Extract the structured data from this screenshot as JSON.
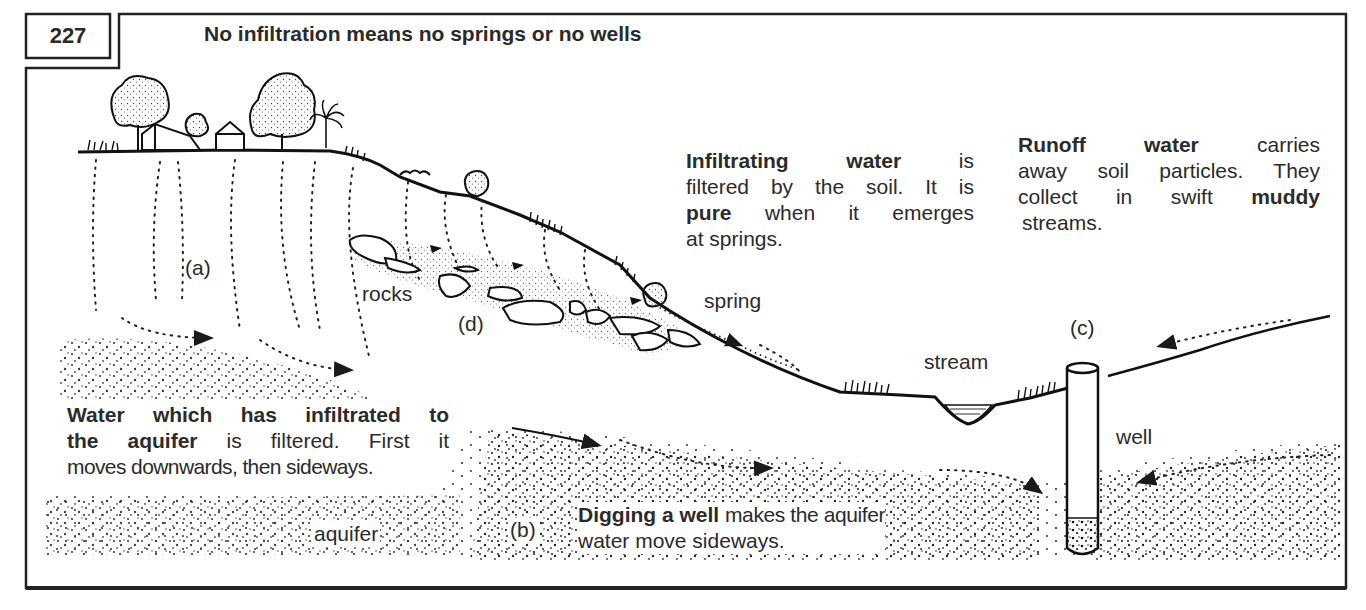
{
  "figure": {
    "number": "227",
    "title": "No infiltration means no springs or no wells"
  },
  "annotations": {
    "infiltrating": {
      "line1_bold_a": "Infiltrating",
      "line1_bold_b": "water",
      "line1_rest": "is",
      "line2": "filtered by the soil. It is",
      "line3_bold": "pure",
      "line3_rest": "when it emerges",
      "line4": "at springs."
    },
    "runoff": {
      "line1_bold_a": "Runoff",
      "line1_bold_b": "water",
      "line1_rest": "carries",
      "line2": "away soil particles. They",
      "line3_a": "collect in swift",
      "line3_bold": "muddy",
      "line4": "streams."
    },
    "aquifer_note": {
      "line1_bold": "Water which has infiltrated to",
      "line2_bold": "the aquifer",
      "line2_rest": "is filtered. First it",
      "line3": "moves downwards, then sideways."
    },
    "well_note": {
      "line1_bold": "Digging a well",
      "line1_rest": "makes the aquifer",
      "line2": "water move sideways."
    }
  },
  "labels": {
    "a": "(a)",
    "b": "(b)",
    "c": "(c)",
    "d": "(d)",
    "rocks": "rocks",
    "spring": "spring",
    "stream": "stream",
    "well": "well",
    "aquifer": "aquifer"
  },
  "colors": {
    "ink": "#1e1e1e",
    "text": "#2b2b2b",
    "background": "#ffffff"
  }
}
